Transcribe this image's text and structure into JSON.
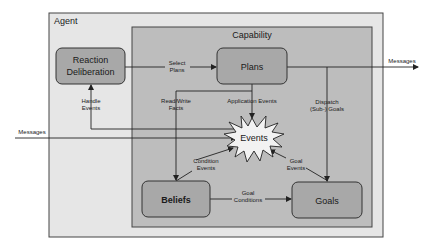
{
  "diagram": {
    "containers": {
      "agent": "Agent",
      "capability": "Capability"
    },
    "nodes": {
      "reaction_line1": "Reaction",
      "reaction_line2": "Deliberation",
      "plans": "Plans",
      "events": "Events",
      "beliefs": "Beliefs",
      "goals": "Goals"
    },
    "edges": {
      "select_plans_1": "Select",
      "select_plans_2": "Plans",
      "handle_events_1": "Handle",
      "handle_events_2": "Events",
      "read_write_1": "Read/Write",
      "read_write_2": "Facts",
      "application_events": "Application Events",
      "dispatch_1": "Dispatch",
      "dispatch_2": "(Sub-) Goals",
      "condition_events_1": "Condition",
      "condition_events_2": "Events",
      "goal_events_1": "Goal",
      "goal_events_2": "Events",
      "goal_conditions_1": "Goal",
      "goal_conditions_2": "Conditions",
      "messages_in": "Messages",
      "messages_out": "Messages"
    },
    "colors": {
      "agent_fill": "#e6e6e6",
      "capability_fill": "#bdbdbd",
      "node_fill": "#a8a8a8",
      "events_fill": "#f2f2f2",
      "stroke": "#333333"
    }
  }
}
